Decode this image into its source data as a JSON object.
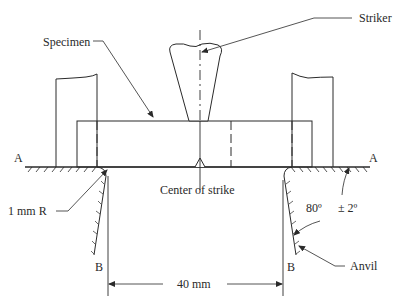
{
  "figure": {
    "type": "technical-diagram"
  },
  "labels": {
    "striker": "Striker",
    "specimen": "Specimen",
    "center_of_strike": "Center of strike",
    "a_left": "A",
    "a_right": "A",
    "radius": "1 mm  R",
    "angle": "80º",
    "tolerance": "± 2º",
    "anvil": "Anvil",
    "b_left": "B",
    "b_right": "B",
    "span": "40 mm"
  },
  "colors": {
    "line": "#2a2a2a",
    "background": "#ffffff"
  }
}
